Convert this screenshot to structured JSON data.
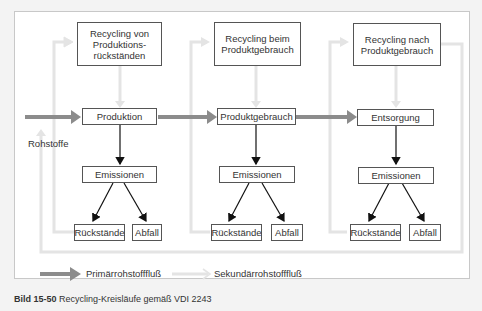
{
  "diagram": {
    "top_boxes": [
      {
        "label": "Recycling von Produktions-rückständen",
        "lines": [
          "Recycling von",
          "Produktions-",
          "rückständen"
        ]
      },
      {
        "label": "Recycling beim Produktgebrauch",
        "lines": [
          "Recycling beim",
          "Produktgebrauch"
        ]
      },
      {
        "label": "Recycling nach Produktgebrauch",
        "lines": [
          "Recycling nach",
          "Produktgebrauch"
        ]
      }
    ],
    "stages": [
      "Produktion",
      "Produktgebrauch",
      "Entsorgung"
    ],
    "emissions": [
      "Emissionen",
      "Emissionen",
      "Emissionen"
    ],
    "outputs": [
      {
        "residue": "Rückstände",
        "waste": "Abfall"
      },
      {
        "residue": "Rückstände",
        "waste": "Abfall"
      },
      {
        "residue": "Rückstände",
        "waste": "Abfall"
      }
    ],
    "input_label": "Rohstoffe",
    "legend": {
      "primary": "Primärrohstofffluß",
      "secondary": "Sekundärrohstofffluß"
    },
    "colors": {
      "primary_flow": "#8a8a8a",
      "secondary_flow": "#e2e2e2",
      "box_border": "#555555",
      "arrow_black": "#111111"
    }
  },
  "caption": {
    "number": "Bild 15-50",
    "text": "Recycling-Kreisläufe gemäß VDI 2243"
  }
}
